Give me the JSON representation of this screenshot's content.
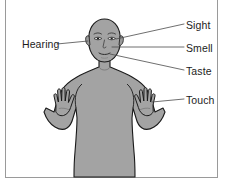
{
  "diagram": {
    "frame": {
      "border_color": "#9a9a9a",
      "background_color": "#ffffff"
    },
    "figure": {
      "name": "human-body-silhouette",
      "fill_color": "#a3a3a3",
      "outline_color": "#1a1a1a",
      "pose": "front-facing torso with both arms raised and palms open"
    },
    "labels": [
      {
        "id": "sight",
        "text": "Sight",
        "side": "right",
        "points_to": "eyes"
      },
      {
        "id": "smell",
        "text": "Smell",
        "side": "right",
        "points_to": "nose"
      },
      {
        "id": "taste",
        "text": "Taste",
        "side": "right",
        "points_to": "mouth"
      },
      {
        "id": "touch",
        "text": "Touch",
        "side": "right",
        "points_to": "right-hand"
      },
      {
        "id": "hearing",
        "text": "Hearing",
        "side": "left",
        "points_to": "left-ear"
      }
    ],
    "leader_line_color": "#4a4a4a"
  }
}
